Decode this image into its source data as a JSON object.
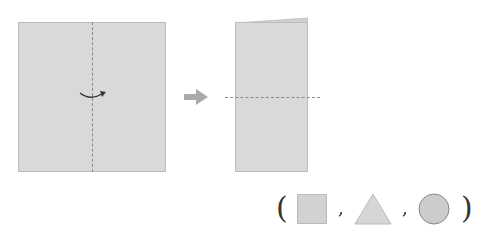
{
  "diagram": {
    "step1": {
      "label": "square paper with vertical fold line",
      "fold_direction": "fold left to right"
    },
    "step2": {
      "label": "folded rectangle with horizontal fold line"
    },
    "transition": "arrow-right",
    "answer_choices": {
      "open": "(",
      "close": ")",
      "separator": ",",
      "options": [
        "square",
        "triangle",
        "circle"
      ]
    },
    "colors": {
      "paper": "#d9d9d9",
      "border": "#bdbdbd",
      "fold_line": "#8a8a8a",
      "arrow": "#aaaaaa",
      "circle": "#cccccc"
    }
  }
}
